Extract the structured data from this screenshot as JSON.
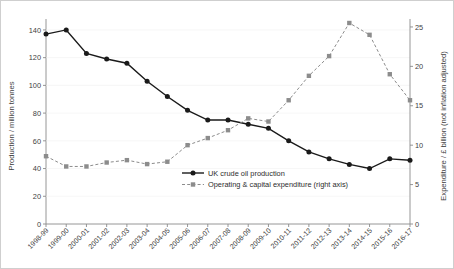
{
  "chart_data": {
    "type": "line",
    "title": "",
    "subtitle": "",
    "xlabel": "",
    "ylabel": "Production / million tonnes",
    "y2label": "Expenditure / £ billion (not inflation adjusted)",
    "grid": false,
    "legend_position": "inside-right",
    "categories": [
      "1998-99",
      "1999-00",
      "2000-01",
      "2001-02",
      "2002-03",
      "2003-04",
      "2004-05",
      "2005-06",
      "2006-07",
      "2007-08",
      "2008-09",
      "2009-10",
      "2010-11",
      "2011-12",
      "2012-13",
      "2013-14",
      "2014-15",
      "2015-16",
      "2016-17"
    ],
    "ylim": [
      0,
      145
    ],
    "yticks": [
      0,
      20,
      40,
      60,
      80,
      100,
      120,
      140
    ],
    "ytick_labels": [
      "0",
      "20",
      "40",
      "60",
      "80",
      "100",
      "120",
      "140"
    ],
    "y2lim": [
      0,
      25.5
    ],
    "y2ticks": [
      0,
      5,
      10,
      15,
      20,
      25
    ],
    "y2tick_labels": [
      "0",
      "5",
      "10",
      "15",
      "20",
      "25"
    ],
    "series": [
      {
        "name": "UK crude oil production",
        "axis": "left",
        "color": "#1a1a1a",
        "marker": "circle",
        "linestyle": "solid",
        "values": [
          137,
          140,
          123,
          119,
          116,
          103,
          92,
          82,
          75,
          75,
          72,
          69,
          60,
          52,
          47,
          43,
          40,
          47,
          46
        ]
      },
      {
        "name": "Operating & capital expenditure (right axis)",
        "axis": "right",
        "color": "#8c8c8c",
        "marker": "square",
        "linestyle": "dashed",
        "values": [
          8.6,
          7.3,
          7.3,
          7.8,
          8.1,
          7.6,
          7.9,
          10.0,
          10.9,
          11.9,
          13.4,
          13.0,
          15.7,
          18.8,
          21.3,
          25.5,
          24.0,
          19.0,
          15.7
        ]
      }
    ]
  },
  "legend": {
    "items": [
      {
        "label": "UK crude oil production",
        "color": "#1a1a1a",
        "marker": "circle",
        "linestyle": "solid"
      },
      {
        "label": "Operating & capital expenditure (right axis)",
        "color": "#8c8c8c",
        "marker": "square",
        "linestyle": "dashed"
      }
    ]
  }
}
